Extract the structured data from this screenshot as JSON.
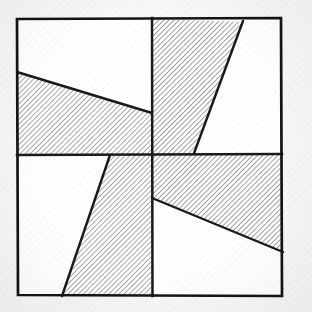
{
  "figure": {
    "title": "Hatched pinwheel quadrant pattern",
    "caption": "",
    "background_color": "#f7f7f5",
    "ink_color": "#1a1a1a",
    "hatch_color": "#5a5a5a",
    "fill_color": "#ffffff",
    "paper_texture": "laid-paper-grain",
    "rotational_symmetry": "4-fold (90 degrees)"
  },
  "canvas": {
    "width": 312,
    "height": 312
  },
  "outer_square": {
    "name": "outer-border",
    "top_left": [
      17,
      19
    ],
    "top_right": [
      281,
      18
    ],
    "bottom_right": [
      282,
      296
    ],
    "bottom_left": [
      18,
      295
    ],
    "stroke_width": 2.6
  },
  "center_cross": {
    "name": "center-divider",
    "center": [
      152,
      155
    ],
    "vertical_line": [
      [
        152,
        18
      ],
      [
        152,
        296
      ]
    ],
    "horizontal_line": [
      [
        17,
        155
      ],
      [
        282,
        154
      ]
    ],
    "stroke_width": 2.4
  },
  "quadrants": [
    {
      "id": "top-left",
      "label": "Quadrant I (top-left)",
      "bounds": [
        [
          17,
          19
        ],
        [
          152,
          19
        ],
        [
          152,
          155
        ],
        [
          17,
          155
        ]
      ],
      "diagonal": {
        "start": [
          17,
          72
        ],
        "end": [
          152,
          113
        ],
        "angle_deg": 17
      },
      "hatched_side": "below",
      "hatch_angle_deg": 45,
      "hatch_spacing_px": 3.6,
      "plain_side": "above"
    },
    {
      "id": "top-right",
      "label": "Quadrant II (top-right)",
      "bounds": [
        [
          152,
          19
        ],
        [
          281,
          18
        ],
        [
          282,
          155
        ],
        [
          152,
          155
        ]
      ],
      "diagonal": {
        "start": [
          243,
          22
        ],
        "end": [
          193,
          155
        ],
        "angle_deg": 69
      },
      "hatched_side": "left",
      "hatch_angle_deg": 45,
      "hatch_spacing_px": 3.6,
      "plain_side": "right"
    },
    {
      "id": "bottom-left",
      "label": "Quadrant III (bottom-left)",
      "bounds": [
        [
          17,
          155
        ],
        [
          152,
          155
        ],
        [
          152,
          296
        ],
        [
          18,
          295
        ]
      ],
      "diagonal": {
        "start": [
          110,
          156
        ],
        "end": [
          62,
          295
        ],
        "angle_deg": 71
      },
      "hatched_side": "right",
      "hatch_angle_deg": 45,
      "hatch_spacing_px": 3.6,
      "plain_side": "left"
    },
    {
      "id": "bottom-right",
      "label": "Quadrant IV (bottom-right)",
      "bounds": [
        [
          152,
          155
        ],
        [
          282,
          154
        ],
        [
          282,
          296
        ],
        [
          152,
          296
        ]
      ],
      "diagonal": {
        "start": [
          152,
          198
        ],
        "end": [
          282,
          252
        ],
        "angle_deg": 23
      },
      "hatched_side": "above",
      "hatch_angle_deg": 45,
      "hatch_spacing_px": 3.6,
      "plain_side": "below"
    }
  ]
}
